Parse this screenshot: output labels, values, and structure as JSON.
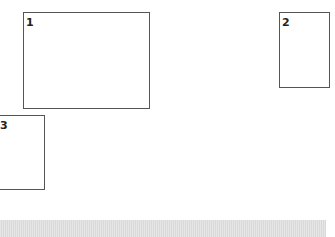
{
  "boxes": [
    {
      "label": "1"
    },
    {
      "label": "2"
    },
    {
      "label": "3"
    }
  ],
  "colors": {
    "border": "#555555",
    "stripe": "#dcdcdc"
  }
}
